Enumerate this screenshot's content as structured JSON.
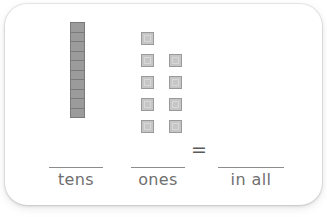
{
  "worksheet": {
    "type": "base-ten-blocks-place-value",
    "tens": {
      "rod_count": 1,
      "segments_per_rod": 10,
      "total_segments": 10,
      "label": "tens",
      "value": 1,
      "fill_color": "#9b9b9b",
      "border_color": "#7a7a7a"
    },
    "ones": {
      "count": 9,
      "label": "ones",
      "value": 9,
      "rows": [
        1,
        2,
        2,
        2,
        2
      ],
      "fill_color": "#c6c6c6",
      "border_color": "#9a9a9a"
    },
    "total": {
      "label": "in all",
      "value": 19
    },
    "equals_symbol": "=",
    "answer_blanks": [
      {
        "name": "tens",
        "label": "tens",
        "value": ""
      },
      {
        "name": "ones",
        "label": "ones",
        "value": ""
      },
      {
        "name": "in-all",
        "label": "in all",
        "value": ""
      }
    ],
    "card_color": "#ffffff",
    "line_color": "#8c8c8c",
    "text_color": "#6f6f6f"
  }
}
